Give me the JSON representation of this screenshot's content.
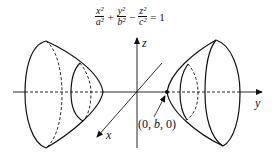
{
  "equation": {
    "terms": [
      {
        "num": "x²",
        "den": "a²"
      },
      {
        "op": "+"
      },
      {
        "num": "y²",
        "den": "b²"
      },
      {
        "op": "−"
      },
      {
        "num": "z²",
        "den": "c²"
      },
      {
        "op": "= 1"
      }
    ]
  },
  "axes": {
    "x_label": "x",
    "y_label": "y",
    "z_label": "z"
  },
  "point": {
    "prefix": "(0, ",
    "var": "b",
    "suffix": ", 0)"
  },
  "colors": {
    "stroke": "#111111",
    "background": "#ffffff"
  }
}
